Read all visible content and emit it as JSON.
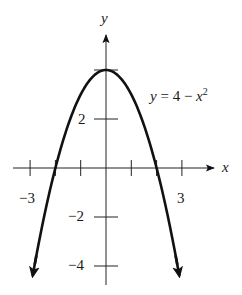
{
  "chart_data": {
    "type": "line",
    "title": "",
    "equation_label": {
      "y": "y",
      "eq": " = 4 − ",
      "x": "x",
      "exp": "2"
    },
    "xlabel": "x",
    "ylabel": "y",
    "xlim": [
      -4,
      4
    ],
    "ylim": [
      -4.7,
      5.5
    ],
    "x_ticks": [
      -3,
      -2,
      -1,
      1,
      2,
      3
    ],
    "x_tick_labels": {
      "-3": "−3",
      "3": "3"
    },
    "y_ticks": [
      4,
      2,
      -2,
      -4
    ],
    "y_tick_labels": {
      "2": "2",
      "-2": "−2",
      "-4": "−4"
    },
    "grid": false,
    "legend": null,
    "series": [
      {
        "name": "y = 4 - x^2",
        "function": "4 - x^2",
        "x": [
          -2.9,
          -2.5,
          -2,
          -1.5,
          -1,
          -0.5,
          0,
          0.5,
          1,
          1.5,
          2,
          2.5,
          2.9
        ],
        "values": [
          -4.41,
          -2.25,
          0,
          1.75,
          3,
          3.75,
          4,
          3.75,
          3,
          1.75,
          0,
          -2.25,
          -4.41
        ],
        "arrows_at_ends": true,
        "color": "#111111"
      }
    ]
  },
  "labels": {
    "x_axis": "x",
    "y_axis": "y",
    "tick_neg3": "−3",
    "tick_3": "3",
    "tick_2": "2",
    "tick_neg2": "−2",
    "tick_neg4": "−4"
  }
}
